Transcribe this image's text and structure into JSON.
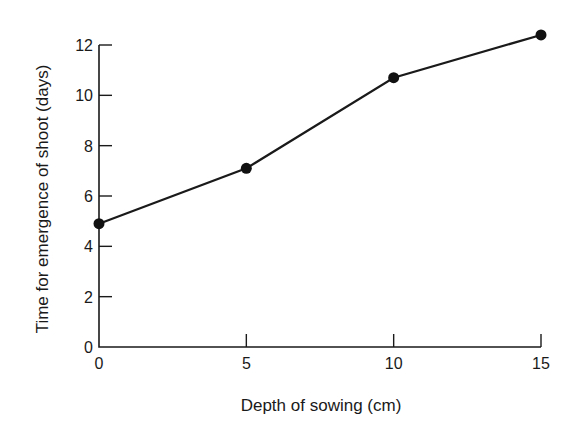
{
  "chart_data": {
    "type": "line",
    "title": "",
    "xlabel": "Depth of sowing (cm)",
    "ylabel": "Time for emergence of shoot (days)",
    "x": [
      0,
      5,
      10,
      15
    ],
    "series": [
      {
        "name": "Time for emergence of shoot",
        "values": [
          4.9,
          7.1,
          10.7,
          12.4
        ],
        "marker": "filled-circle",
        "color": "#111111"
      }
    ],
    "xlim": [
      0,
      15
    ],
    "ylim": [
      0,
      12
    ],
    "xticks": [
      0,
      5,
      10,
      15
    ],
    "yticks": [
      0,
      2,
      4,
      6,
      8,
      10,
      12
    ],
    "grid": false,
    "legend": null,
    "tick_direction": "inward"
  }
}
